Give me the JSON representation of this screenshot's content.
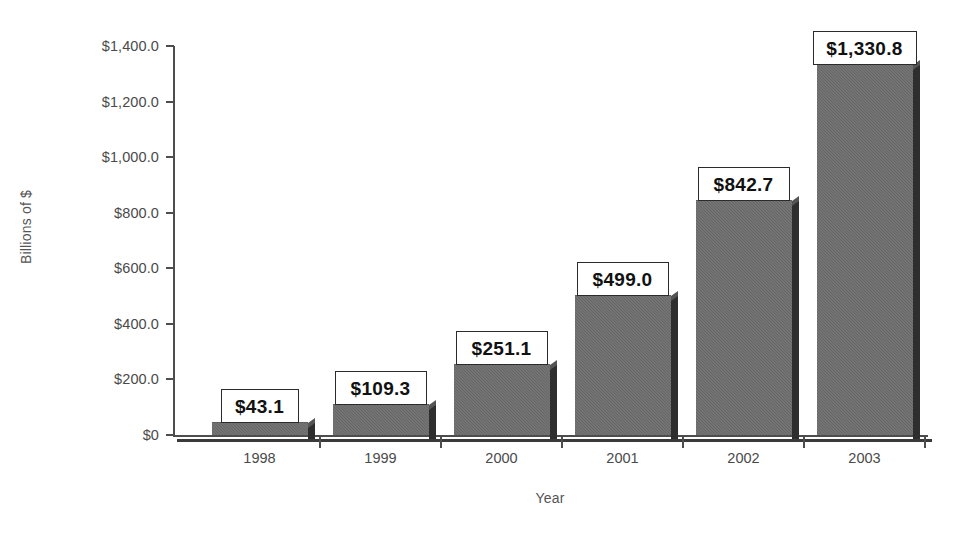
{
  "chart_data": {
    "type": "bar",
    "title": "",
    "xlabel": "Year",
    "ylabel": "Billions of $",
    "categories": [
      "1998",
      "1999",
      "2000",
      "2001",
      "2002",
      "2003"
    ],
    "values": [
      43.1,
      109.3,
      251.1,
      499.0,
      842.7,
      1330.8
    ],
    "value_labels": [
      "$43.1",
      "$109.3",
      "$251.1",
      "$499.0",
      "$842.7",
      "$1,330.8"
    ],
    "ylim": [
      0,
      1400
    ],
    "ytick_values": [
      1400,
      1200,
      1000,
      800,
      600,
      400,
      200,
      0
    ],
    "ytick_labels": [
      "$1,400.0",
      "$1,200.0",
      "$1,000.0",
      "$800.0",
      "$600.0",
      "$400.0",
      "$200.0",
      "$0"
    ],
    "grid": false,
    "legend": "none",
    "bar_color": "#6c6c6c",
    "bar_shadow_color": "#2e2e2e",
    "axis_color": "#4d4d4d",
    "label_box_border": "#2b2b2b",
    "label_box_fill": "#ffffff"
  },
  "axes": {
    "y_title": "Billions of $",
    "x_title": "Year"
  }
}
